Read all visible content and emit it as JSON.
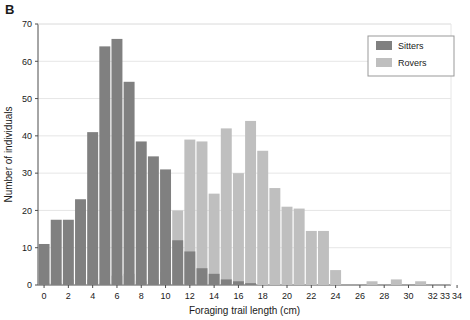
{
  "panel": {
    "label": "B"
  },
  "colors": {
    "sitters": "#808080",
    "rovers": "#bfbfbf",
    "axis": "#4d4d4d",
    "grid": "#e6e6e6",
    "text": "#1a1a1a",
    "legend_border": "#999999",
    "background": "#ffffff"
  },
  "legend": {
    "position": "top-right",
    "entries": [
      {
        "label": "Sitters",
        "color": "#808080"
      },
      {
        "label": "Rovers",
        "color": "#bfbfbf"
      }
    ]
  },
  "chart_data": {
    "type": "bar",
    "title": "",
    "subtitle": "",
    "xlabel": "Foraging trail length (cm)",
    "ylabel": "Number of individuals",
    "xlim": [
      0,
      34
    ],
    "ylim": [
      0,
      70
    ],
    "yticks": [
      0,
      10,
      20,
      30,
      40,
      50,
      60,
      70
    ],
    "ytick_labels": [
      "0",
      "10",
      "20",
      "30",
      "40",
      "50",
      "60",
      "70"
    ],
    "xticks": [
      0,
      2,
      4,
      6,
      8,
      10,
      12,
      14,
      16,
      18,
      20,
      22,
      24,
      26,
      28,
      30,
      32,
      33,
      34
    ],
    "xtick_labels": [
      "0",
      "2",
      "4",
      "6",
      "8",
      "10",
      "12",
      "14",
      "16",
      "18",
      "20",
      "22",
      "24",
      "26",
      "28",
      "30",
      "32",
      "33",
      "34"
    ],
    "grid": "horizontal",
    "bin_width": 1,
    "overlap": "overlaid",
    "x": [
      0,
      1,
      2,
      3,
      4,
      5,
      6,
      7,
      8,
      9,
      10,
      11,
      12,
      13,
      14,
      15,
      16,
      17,
      18,
      19,
      20,
      21,
      22,
      23,
      24,
      25,
      26,
      27,
      28,
      29,
      30,
      31,
      32,
      33
    ],
    "series": [
      {
        "name": "Sitters",
        "color": "#808080",
        "values": [
          11,
          17.5,
          17.5,
          23,
          41,
          64,
          66,
          54.5,
          38.5,
          34.5,
          31,
          12,
          9,
          4.5,
          3,
          1.5,
          1,
          0.5,
          0,
          0,
          0,
          0,
          0,
          0,
          0,
          0,
          0,
          0,
          0,
          0,
          0,
          0,
          0,
          0
        ]
      },
      {
        "name": "Rovers",
        "color": "#bfbfbf",
        "values": [
          0.5,
          0.5,
          1.5,
          0.5,
          1.5,
          0.5,
          2.5,
          3,
          1,
          1.5,
          3.5,
          20,
          39,
          38.5,
          24.5,
          42,
          30,
          44,
          36,
          26,
          21,
          20.5,
          14.5,
          14.5,
          4,
          0,
          0,
          1,
          0,
          1.5,
          0,
          1,
          0,
          0
        ]
      }
    ]
  }
}
